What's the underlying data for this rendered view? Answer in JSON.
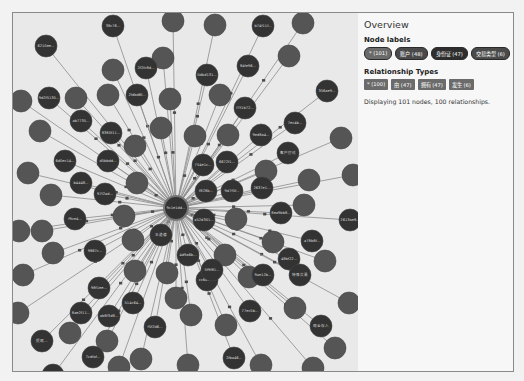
{
  "sidebar": {
    "title": "Overview",
    "node_labels_heading": "Node labels",
    "node_labels": [
      {
        "label": "* (101)",
        "style": "mid"
      },
      {
        "label": "账户 (48)",
        "style": "normal"
      },
      {
        "label": "身份证 (47)",
        "style": "dark"
      },
      {
        "label": "交易类型 (6)",
        "style": "normal"
      }
    ],
    "relationship_types_heading": "Relationship Types",
    "relationship_types": [
      {
        "label": "* (100)"
      },
      {
        "label": "由 (47)"
      },
      {
        "label": "拥有 (47)"
      },
      {
        "label": "发生 (6)"
      }
    ],
    "status_text": "Displaying 101 nodes, 100 relationships."
  },
  "graph": {
    "center": {
      "x": 163,
      "y": 195,
      "r": 12,
      "label": "9c1e1dd..."
    },
    "colors": {
      "background": "#e9e9e9",
      "node_dark": "#333333",
      "node_mid": "#555555",
      "edge": "#8c8c8c",
      "edge_label_box": "#4d4d4d"
    },
    "nodes": [
      {
        "x": 100,
        "y": 13,
        "r": 11,
        "t": "d",
        "label": "38c76..."
      },
      {
        "x": 160,
        "y": 8,
        "r": 11,
        "t": "m",
        "label": ""
      },
      {
        "x": 202,
        "y": 12,
        "r": 11,
        "t": "m",
        "label": ""
      },
      {
        "x": 250,
        "y": 13,
        "r": 11,
        "t": "d",
        "label": "b74f11f..."
      },
      {
        "x": 290,
        "y": 10,
        "r": 11,
        "t": "m",
        "label": ""
      },
      {
        "x": 33,
        "y": 33,
        "r": 11,
        "t": "d",
        "label": "6210ee..."
      },
      {
        "x": 100,
        "y": 57,
        "r": 11,
        "t": "m",
        "label": ""
      },
      {
        "x": 150,
        "y": 45,
        "r": 11,
        "t": "m",
        "label": ""
      },
      {
        "x": 133,
        "y": 55,
        "r": 11,
        "t": "d",
        "label": "2f2fc8d..."
      },
      {
        "x": 194,
        "y": 62,
        "r": 11,
        "t": "d",
        "label": "0dbd131..."
      },
      {
        "x": 235,
        "y": 53,
        "r": 11,
        "t": "d",
        "label": "84fe96..."
      },
      {
        "x": 276,
        "y": 43,
        "r": 11,
        "t": "m",
        "label": ""
      },
      {
        "x": 63,
        "y": 85,
        "r": 11,
        "t": "m",
        "label": ""
      },
      {
        "x": 36,
        "y": 85,
        "r": 11,
        "t": "d",
        "label": "9d2f5130..."
      },
      {
        "x": 95,
        "y": 82,
        "r": 11,
        "t": "m",
        "label": ""
      },
      {
        "x": 124,
        "y": 82,
        "r": 11,
        "t": "d",
        "label": "2fdbd6f..."
      },
      {
        "x": 157,
        "y": 86,
        "r": 11,
        "t": "m",
        "label": ""
      },
      {
        "x": 207,
        "y": 82,
        "r": 11,
        "t": "m",
        "label": ""
      },
      {
        "x": 232,
        "y": 95,
        "r": 11,
        "t": "d",
        "label": "f7f1b72..."
      },
      {
        "x": 314,
        "y": 78,
        "r": 11,
        "t": "d",
        "label": "356ae9..."
      },
      {
        "x": 8,
        "y": 88,
        "r": 11,
        "t": "m",
        "label": ""
      },
      {
        "x": 68,
        "y": 108,
        "r": 11,
        "t": "d",
        "label": "ab7735..."
      },
      {
        "x": 27,
        "y": 118,
        "r": 11,
        "t": "m",
        "label": ""
      },
      {
        "x": 98,
        "y": 120,
        "r": 11,
        "t": "d",
        "label": "8380f11..."
      },
      {
        "x": 148,
        "y": 115,
        "r": 11,
        "t": "m",
        "label": ""
      },
      {
        "x": 182,
        "y": 123,
        "r": 11,
        "t": "m",
        "label": ""
      },
      {
        "x": 215,
        "y": 122,
        "r": 11,
        "t": "m",
        "label": ""
      },
      {
        "x": 248,
        "y": 122,
        "r": 11,
        "t": "d",
        "label": "9ed8a4..."
      },
      {
        "x": 282,
        "y": 110,
        "r": 11,
        "t": "d",
        "label": "7ec4b..."
      },
      {
        "x": 328,
        "y": 125,
        "r": 11,
        "t": "m",
        "label": ""
      },
      {
        "x": 52,
        "y": 148,
        "r": 11,
        "t": "d",
        "label": "6d0ec14..."
      },
      {
        "x": 15,
        "y": 160,
        "r": 11,
        "t": "m",
        "label": ""
      },
      {
        "x": 95,
        "y": 148,
        "r": 11,
        "t": "d",
        "label": "d5bbdd..."
      },
      {
        "x": 122,
        "y": 133,
        "r": 11,
        "t": "m",
        "label": ""
      },
      {
        "x": 190,
        "y": 152,
        "r": 11,
        "t": "d",
        "label": "754e1c..."
      },
      {
        "x": 214,
        "y": 149,
        "r": 11,
        "t": "d",
        "label": "6672f1..."
      },
      {
        "x": 275,
        "y": 140,
        "r": 11,
        "t": "d",
        "label": "客户打访"
      },
      {
        "x": 253,
        "y": 158,
        "r": 11,
        "t": "m",
        "label": ""
      },
      {
        "x": 68,
        "y": 170,
        "r": 11,
        "t": "d",
        "label": "b4448..."
      },
      {
        "x": 92,
        "y": 181,
        "r": 11,
        "t": "d",
        "label": "97f2ad..."
      },
      {
        "x": 38,
        "y": 182,
        "r": 11,
        "t": "m",
        "label": ""
      },
      {
        "x": 124,
        "y": 170,
        "r": 11,
        "t": "m",
        "label": ""
      },
      {
        "x": 193,
        "y": 178,
        "r": 11,
        "t": "d",
        "label": "f828b..."
      },
      {
        "x": 219,
        "y": 178,
        "r": 11,
        "t": "d",
        "label": "9d7f5f..."
      },
      {
        "x": 249,
        "y": 175,
        "r": 11,
        "t": "d",
        "label": "2637e1..."
      },
      {
        "x": 296,
        "y": 167,
        "r": 11,
        "t": "m",
        "label": ""
      },
      {
        "x": 340,
        "y": 162,
        "r": 11,
        "t": "m",
        "label": ""
      },
      {
        "x": 6,
        "y": 218,
        "r": 11,
        "t": "m",
        "label": ""
      },
      {
        "x": 62,
        "y": 206,
        "r": 11,
        "t": "d",
        "label": "f9ce4..."
      },
      {
        "x": 29,
        "y": 218,
        "r": 11,
        "t": "m",
        "label": ""
      },
      {
        "x": 111,
        "y": 203,
        "r": 11,
        "t": "m",
        "label": ""
      },
      {
        "x": 148,
        "y": 222,
        "r": 11,
        "t": "d",
        "label": "王道德"
      },
      {
        "x": 191,
        "y": 207,
        "r": 11,
        "t": "d",
        "label": "a52d301..."
      },
      {
        "x": 223,
        "y": 206,
        "r": 11,
        "t": "m",
        "label": ""
      },
      {
        "x": 268,
        "y": 200,
        "r": 11,
        "t": "d",
        "label": "8ea9bb8..."
      },
      {
        "x": 291,
        "y": 192,
        "r": 11,
        "t": "m",
        "label": ""
      },
      {
        "x": 337,
        "y": 207,
        "r": 11,
        "t": "d",
        "label": "2613ae8..."
      },
      {
        "x": 120,
        "y": 227,
        "r": 11,
        "t": "m",
        "label": ""
      },
      {
        "x": 260,
        "y": 229,
        "r": 11,
        "t": "m",
        "label": ""
      },
      {
        "x": 299,
        "y": 228,
        "r": 11,
        "t": "d",
        "label": "a78b8f..."
      },
      {
        "x": 40,
        "y": 240,
        "r": 11,
        "t": "m",
        "label": ""
      },
      {
        "x": 82,
        "y": 238,
        "r": 11,
        "t": "d",
        "label": "9867c..."
      },
      {
        "x": 175,
        "y": 242,
        "r": 11,
        "t": "d",
        "label": "4d9a6b..."
      },
      {
        "x": 212,
        "y": 242,
        "r": 11,
        "t": "m",
        "label": ""
      },
      {
        "x": 194,
        "y": 267,
        "r": 11,
        "t": "d",
        "label": "cc6d12..."
      },
      {
        "x": 236,
        "y": 264,
        "r": 11,
        "t": "m",
        "label": ""
      },
      {
        "x": 276,
        "y": 246,
        "r": 11,
        "t": "d",
        "label": "48bf22..."
      },
      {
        "x": 312,
        "y": 248,
        "r": 11,
        "t": "m",
        "label": ""
      },
      {
        "x": 10,
        "y": 262,
        "r": 11,
        "t": "m",
        "label": ""
      },
      {
        "x": 86,
        "y": 275,
        "r": 11,
        "t": "d",
        "label": "98f1ee..."
      },
      {
        "x": 122,
        "y": 258,
        "r": 11,
        "t": "m",
        "label": ""
      },
      {
        "x": 154,
        "y": 260,
        "r": 11,
        "t": "m",
        "label": ""
      },
      {
        "x": 199,
        "y": 257,
        "r": 11,
        "t": "d",
        "label": "5f9f81..."
      },
      {
        "x": 250,
        "y": 262,
        "r": 11,
        "t": "d",
        "label": "9ae12b..."
      },
      {
        "x": 287,
        "y": 262,
        "r": 11,
        "t": "d",
        "label": "特殊交易"
      },
      {
        "x": 68,
        "y": 300,
        "r": 11,
        "t": "d",
        "label": "8ae2f11..."
      },
      {
        "x": 96,
        "y": 303,
        "r": 11,
        "t": "d",
        "label": "ab8f3d8..."
      },
      {
        "x": 120,
        "y": 290,
        "r": 11,
        "t": "d",
        "label": "514c64..."
      },
      {
        "x": 163,
        "y": 285,
        "r": 11,
        "t": "m",
        "label": ""
      },
      {
        "x": 178,
        "y": 302,
        "r": 11,
        "t": "m",
        "label": ""
      },
      {
        "x": 213,
        "y": 312,
        "r": 11,
        "t": "m",
        "label": ""
      },
      {
        "x": 237,
        "y": 298,
        "r": 11,
        "t": "d",
        "label": "77ec5b..."
      },
      {
        "x": 282,
        "y": 295,
        "r": 11,
        "t": "m",
        "label": ""
      },
      {
        "x": 308,
        "y": 313,
        "r": 11,
        "t": "d",
        "label": "现金存入"
      },
      {
        "x": 29,
        "y": 328,
        "r": 11,
        "t": "d",
        "label": "提现..."
      },
      {
        "x": 57,
        "y": 320,
        "r": 11,
        "t": "m",
        "label": ""
      },
      {
        "x": 142,
        "y": 314,
        "r": 11,
        "t": "d",
        "label": "f5f2d6..."
      },
      {
        "x": 94,
        "y": 328,
        "r": 11,
        "t": "m",
        "label": ""
      },
      {
        "x": 20,
        "y": 262,
        "r": 0,
        "t": "m",
        "label": ""
      },
      {
        "x": 80,
        "y": 344,
        "r": 11,
        "t": "d",
        "label": "7cdfaf..."
      },
      {
        "x": 128,
        "y": 346,
        "r": 11,
        "t": "m",
        "label": ""
      },
      {
        "x": 175,
        "y": 352,
        "r": 11,
        "t": "m",
        "label": ""
      },
      {
        "x": 221,
        "y": 345,
        "r": 11,
        "t": "d",
        "label": "2fba46..."
      },
      {
        "x": 248,
        "y": 352,
        "r": 11,
        "t": "m",
        "label": ""
      },
      {
        "x": 300,
        "y": 355,
        "r": 11,
        "t": "m",
        "label": ""
      },
      {
        "x": 40,
        "y": 362,
        "r": 11,
        "t": "d",
        "label": "9aa8f7..."
      },
      {
        "x": 5,
        "y": 300,
        "r": 11,
        "t": "m",
        "label": ""
      },
      {
        "x": 336,
        "y": 290,
        "r": 11,
        "t": "m",
        "label": ""
      },
      {
        "x": 106,
        "y": 354,
        "r": 11,
        "t": "m",
        "label": ""
      },
      {
        "x": 322,
        "y": 335,
        "r": 11,
        "t": "m",
        "label": ""
      }
    ]
  }
}
